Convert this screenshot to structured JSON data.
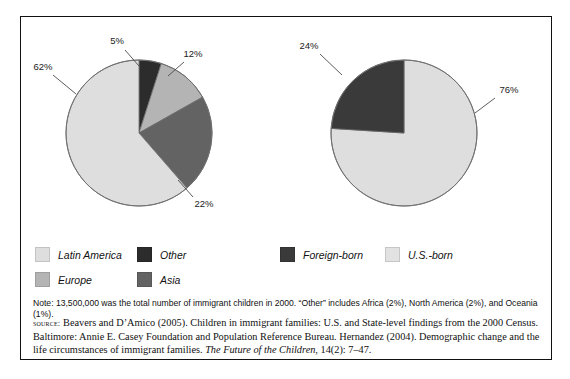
{
  "chart_data": [
    {
      "type": "pie",
      "title": "Region of origin of immigrant children",
      "categories": [
        "Other",
        "Europe",
        "Asia",
        "Latin America"
      ],
      "values": [
        5,
        12,
        22,
        62
      ],
      "labels": [
        "5%",
        "12%",
        "22%",
        "62%"
      ],
      "colors": [
        "#2c2c2c",
        "#b4b4b4",
        "#636363",
        "#dedede"
      ],
      "start_angle_deg": 0,
      "direction": "clockwise",
      "legend_position": "below"
    },
    {
      "type": "pie",
      "title": "Nativity of immigrant children",
      "categories": [
        "U.S.-born",
        "Foreign-born"
      ],
      "values": [
        76,
        24
      ],
      "labels": [
        "76%",
        "24%"
      ],
      "colors": [
        "#dedede",
        "#3a3a3a"
      ],
      "start_angle_deg": 0,
      "direction": "clockwise",
      "legend_position": "below"
    }
  ],
  "legend": {
    "left": [
      {
        "label": "Latin America",
        "color": "#dedede"
      },
      {
        "label": "Europe",
        "color": "#b4b4b4"
      },
      {
        "label": "Other",
        "color": "#2c2c2c"
      },
      {
        "label": "Asia",
        "color": "#636363"
      }
    ],
    "right": [
      {
        "label": "Foreign-born",
        "color": "#3a3a3a"
      },
      {
        "label": "U.S.-born",
        "color": "#e2e2e2"
      }
    ]
  },
  "note": {
    "text": "Note: 13,500,000 was the total number of immigrant children in 2000. “Other” includes Africa (2%), North America (2%), and Oceania (1%)."
  },
  "source": {
    "prefix": "source:",
    "line_a": " Beavers and D’Amico (2005). Children in immigrant families: U.S. and State-level findings from the 2000 Census. Baltimore: Annie E. Casey Foundation and Population Reference Bureau. Hernandez (2004). Demographic change and the life circumstances of immigrant families. ",
    "italic_title": "The Future of the Children",
    "line_b": ", 14(2): 7–47."
  }
}
